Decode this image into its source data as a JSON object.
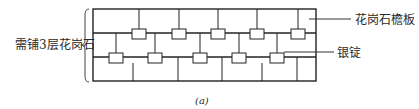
{
  "diagram": {
    "left_label": "需铺3层花岗石",
    "callouts": [
      {
        "label": "花岗石檐板"
      },
      {
        "label": "银锭"
      }
    ],
    "caption": "(a)",
    "colors": {
      "line": "#222222",
      "text": "#2a2a2a",
      "background": "#ffffff"
    }
  }
}
